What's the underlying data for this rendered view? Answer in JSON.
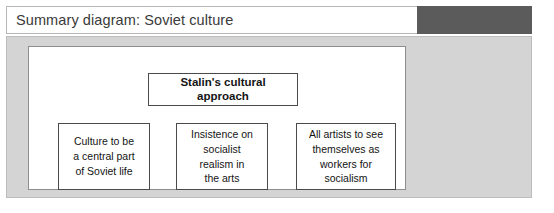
{
  "title_bar": {
    "title": "Summary diagram: Soviet culture",
    "dark_block_color": "#5b5b5b",
    "background_color": "#ffffff"
  },
  "panel": {
    "background_color": "#d4d4d4",
    "border_color": "#bdbdbd"
  },
  "canvas": {
    "background_color": "#ffffff",
    "border_color": "#8e8e8e"
  },
  "diagram": {
    "type": "hierarchy",
    "root": {
      "label": "Stalin's cultural approach",
      "bold": true
    },
    "children": [
      {
        "label": "Culture to be a central part of Soviet life",
        "lines": [
          "Culture to be",
          "a central part",
          "of Soviet life"
        ]
      },
      {
        "label": "Insistence on socialist realism in the arts",
        "lines": [
          "Insistence on",
          "socialist",
          "realism in",
          "the arts"
        ]
      },
      {
        "label": "All artists to see themselves as workers for socialism",
        "lines": [
          "All artists to see",
          "themselves as",
          "workers for",
          "socialism"
        ]
      }
    ]
  }
}
